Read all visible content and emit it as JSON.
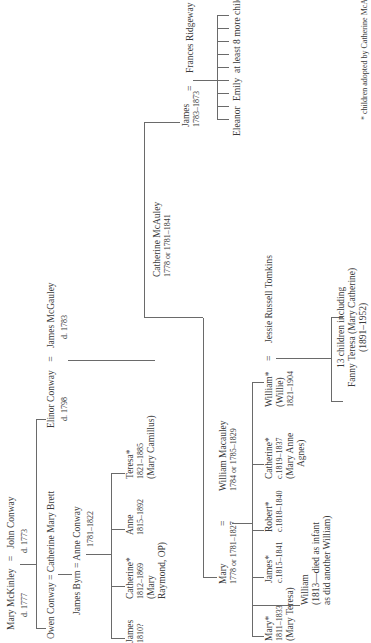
{
  "generation1": {
    "left_spouse": {
      "name": "Mary McKinley",
      "dates": "d. 1777"
    },
    "equals": "=",
    "right_spouse": {
      "name": "John Conway",
      "dates": "d. 1773"
    }
  },
  "conway_children": [
    {
      "name": "Owen Conway",
      "spouse": "Catherine Mary Brett",
      "equals": "="
    },
    {
      "name": "Elinor Conway",
      "dates": "d. 1798",
      "spouse": "James McGauley",
      "spouse_dates": "d. 1783",
      "equals": "="
    }
  ],
  "byrn_couple": {
    "left": "James Byrn",
    "equals": "=",
    "right": "Anne Conway",
    "right_dates": "1781–1822"
  },
  "byrn_children": [
    {
      "name": "James",
      "dates": "1810?"
    },
    {
      "name": "Catherine*",
      "dates": "1812–1869",
      "note1": "(Mary",
      "note2": "Raymond, OP)"
    },
    {
      "name": "Anne",
      "dates": "1815–1892"
    },
    {
      "name": "Teresa*",
      "dates": "1821–1885",
      "note1": "(Mary Camillus)"
    }
  ],
  "mcgauley_children": {
    "catherine": {
      "name": "Catherine McAuley",
      "dates": "1778 or 1781–1841"
    },
    "james": {
      "name": "James",
      "dates": "1783–1873",
      "equals": "=",
      "spouse": "Frances Ridgeway"
    },
    "mary": {
      "name": "Mary",
      "dates": "1778 or 1781–1827",
      "equals": "=",
      "spouse": "William Macauley",
      "spouse_dates": "1784 or 1785–1829"
    }
  },
  "james_children": {
    "named": [
      "Eleanor",
      "Emily"
    ],
    "more": "at least 8 more children"
  },
  "macauley_children": [
    {
      "name": "Mary*",
      "dates": "1811–1833",
      "note": "(Mary Teresa)"
    },
    {
      "name": "James*",
      "dates": "c.1815–1841"
    },
    {
      "name": "Robert*",
      "dates": "c.1818–1840"
    },
    {
      "name": "Catherine*",
      "dates": "c.1819–1837",
      "note1": "(Mary Anne",
      "note2": "Agnes)"
    },
    {
      "name": "William*",
      "nickname": "(Willie)",
      "dates": "1821–1904",
      "equals": "=",
      "spouse": "Jessie Russell Tomkins"
    }
  ],
  "infant_note": {
    "name": "William",
    "line1": "(1813—died as infant",
    "line2": "as did another William)"
  },
  "william_children": {
    "line1": "13 children including",
    "line2": "Fanny Teresa (Mary Catherine)",
    "line3": "(1891–1952)"
  },
  "footnote": "* children adopted by Catherine McAuley",
  "colors": {
    "line": "#6a6a6a",
    "text": "#3a3a3a",
    "background": "#ffffff"
  }
}
